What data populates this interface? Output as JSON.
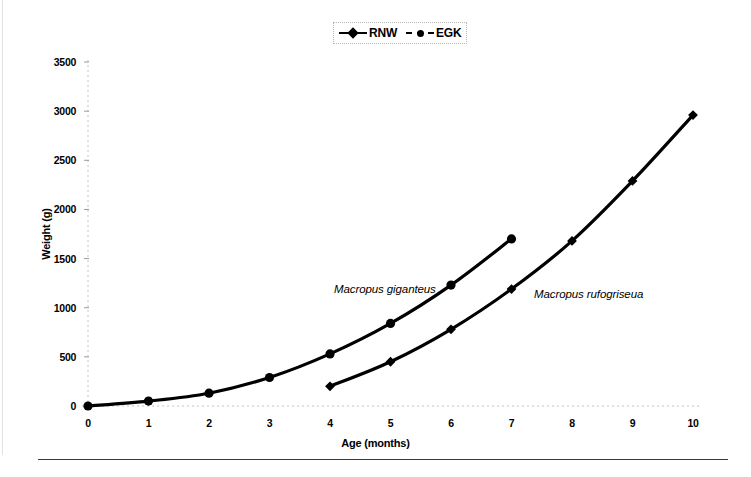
{
  "figure": {
    "legend": {
      "position": "top-center",
      "entries": [
        {
          "label": "RNW",
          "marker": "diamond",
          "line": "solid"
        },
        {
          "label": "EGK",
          "marker": "circle",
          "line": "dashed"
        }
      ]
    },
    "annotations": [
      {
        "text": "Macropus giganteus",
        "series": "EGK"
      },
      {
        "text": "Macropus rufogriseua",
        "series": "RNW"
      }
    ]
  },
  "chart_data": {
    "type": "line",
    "title": "",
    "xlabel": "Age (months)",
    "ylabel": "Weight (g)",
    "xlim": [
      0,
      10
    ],
    "ylim": [
      0,
      3500
    ],
    "xticks": [
      0,
      1,
      2,
      3,
      4,
      5,
      6,
      7,
      8,
      9,
      10
    ],
    "yticks": [
      0,
      500,
      1000,
      1500,
      2000,
      2500,
      3000,
      3500
    ],
    "xtick_labels": [
      "0",
      "1",
      "2",
      "3",
      "4",
      "5",
      "6",
      "7",
      "8",
      "9",
      "10"
    ],
    "ytick_labels": [
      "0",
      "500",
      "1000",
      "1500",
      "2000",
      "2500",
      "3000",
      "3500"
    ],
    "grid": false,
    "legend_position": "top-center",
    "line_color": "#000000",
    "series": [
      {
        "name": "EGK",
        "annotation": "Macropus giganteus",
        "marker": "circle",
        "line": "dashed",
        "x": [
          0,
          1,
          2,
          3,
          4,
          5,
          6,
          7
        ],
        "values": [
          0,
          50,
          130,
          290,
          530,
          840,
          1230,
          1700
        ]
      },
      {
        "name": "RNW",
        "annotation": "Macropus rufogriseua",
        "marker": "diamond",
        "line": "solid",
        "x": [
          4,
          5,
          6,
          7,
          8,
          9,
          10
        ],
        "values": [
          200,
          450,
          780,
          1190,
          1680,
          2290,
          2960
        ]
      }
    ]
  }
}
